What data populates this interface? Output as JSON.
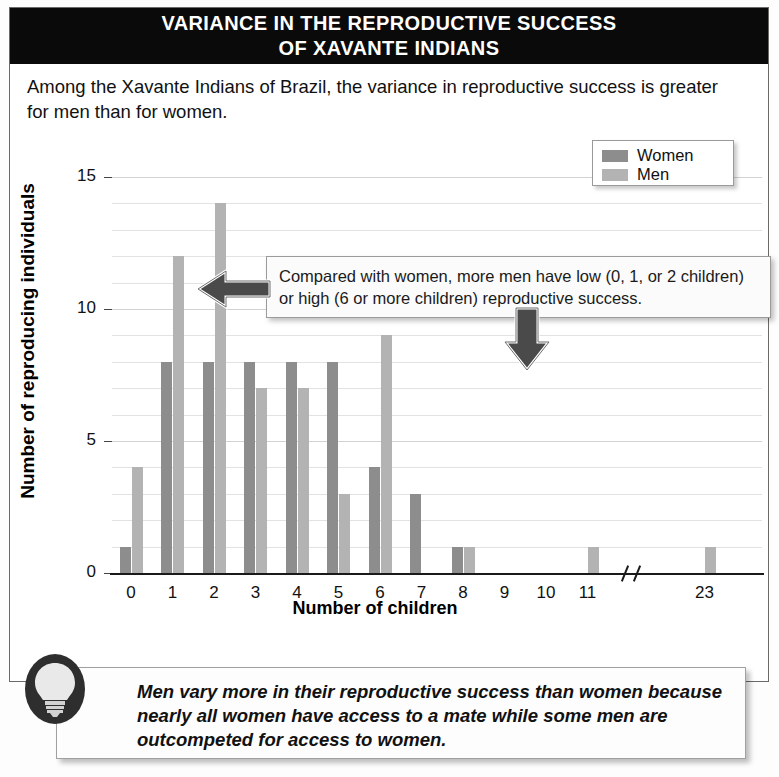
{
  "title": {
    "line1": "VARIANCE IN THE REPRODUCTIVE SUCCESS",
    "line2": "OF XAVANTE INDIANS"
  },
  "intro": "Among the Xavante Indians of Brazil, the variance in reproductive success is greater for men than for women.",
  "callout": {
    "text": "Compared with women, more men have low (0, 1, or 2 children) or high (6 or more children) reproductive success.",
    "arrow_left_icon": "arrow-left-icon",
    "arrow_down_icon": "arrow-down-icon"
  },
  "caption": {
    "icon": "lightbulb-icon",
    "text": "Men vary more in their reproductive success than women because nearly all women have access to a mate while some men are outcompeted for access to women."
  },
  "legend": {
    "position": "top-right",
    "entries": [
      {
        "label": "Women",
        "color": "#8d8d8d"
      },
      {
        "label": "Men",
        "color": "#b3b3b3"
      }
    ]
  },
  "chart_data": {
    "type": "bar",
    "title": "VARIANCE IN THE REPRODUCTIVE SUCCESS OF XAVANTE INDIANS",
    "xlabel": "Number of children",
    "ylabel": "Number of reproducing individuals",
    "categories": [
      "0",
      "1",
      "2",
      "3",
      "4",
      "5",
      "6",
      "7",
      "8",
      "9",
      "10",
      "11",
      "23"
    ],
    "axis_break_after": "11",
    "series": [
      {
        "name": "Women",
        "color": "#8d8d8d",
        "values": [
          1,
          8,
          8,
          8,
          8,
          8,
          4,
          3,
          1,
          0,
          0,
          0,
          0
        ]
      },
      {
        "name": "Men",
        "color": "#b3b3b3",
        "values": [
          4,
          12,
          14,
          7,
          7,
          3,
          9,
          0,
          1,
          0,
          0,
          1,
          1
        ]
      }
    ],
    "yticks": [
      0,
      5,
      10,
      15
    ],
    "ylim": [
      0,
      15
    ],
    "grid": true,
    "gridlines_every": 1
  },
  "colors": {
    "title_bg": "#0a0a0a",
    "title_fg": "#ffffff",
    "women": "#8d8d8d",
    "men": "#b3b3b3",
    "axis": "#1a1a1a",
    "grid": "#e2e2e2"
  }
}
